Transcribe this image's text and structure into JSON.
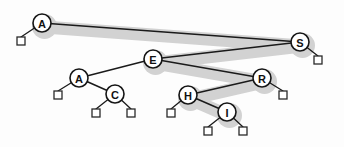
{
  "figure": {
    "background_color": "#fdfdfd",
    "node_fill": "#ffffff",
    "node_stroke": "#151515",
    "edge_color": "#1a1a1a",
    "highlight_color": "#d2d2d2",
    "null_square_fill": "#ffffff",
    "null_square_stroke": "#2a2a2a"
  },
  "chart_data": {
    "type": "diagram",
    "diagram_kind": "binary-search-tree",
    "nodes": [
      {
        "id": "n0",
        "label": "A",
        "x": 42,
        "y": 23,
        "r": 9,
        "highlighted": true
      },
      {
        "id": "n1",
        "label": "S",
        "x": 300,
        "y": 42,
        "r": 9,
        "highlighted": true
      },
      {
        "id": "n2",
        "label": "E",
        "x": 153,
        "y": 59,
        "r": 9,
        "highlighted": true
      },
      {
        "id": "n3",
        "label": "A",
        "x": 79,
        "y": 78,
        "r": 9,
        "highlighted": false
      },
      {
        "id": "n4",
        "label": "R",
        "x": 262,
        "y": 78,
        "r": 9,
        "highlighted": true
      },
      {
        "id": "n5",
        "label": "C",
        "x": 115,
        "y": 94,
        "r": 9,
        "highlighted": false
      },
      {
        "id": "n6",
        "label": "H",
        "x": 188,
        "y": 95,
        "r": 9,
        "highlighted": true
      },
      {
        "id": "n7",
        "label": "I",
        "x": 227,
        "y": 112,
        "r": 9,
        "highlighted": true
      }
    ],
    "edges": [
      {
        "from": "n0",
        "to": "n1",
        "label": "A-S"
      },
      {
        "from": "n1",
        "to": "n2",
        "label": "S-E"
      },
      {
        "from": "n2",
        "to": "n3",
        "label": "E-A"
      },
      {
        "from": "n2",
        "to": "n4",
        "label": "E-R"
      },
      {
        "from": "n3",
        "to": "n5",
        "label": "A-C"
      },
      {
        "from": "n4",
        "to": "n6",
        "label": "R-H"
      },
      {
        "from": "n6",
        "to": "n7",
        "label": "H-I"
      }
    ],
    "null_links": [
      {
        "parent": "n0",
        "side": "left",
        "x": 21,
        "y": 41,
        "size": 8
      },
      {
        "parent": "n1",
        "side": "right",
        "x": 318,
        "y": 60,
        "size": 8
      },
      {
        "parent": "n3",
        "side": "left",
        "x": 58,
        "y": 95,
        "size": 8
      },
      {
        "parent": "n4",
        "side": "right",
        "x": 283,
        "y": 95,
        "size": 8
      },
      {
        "parent": "n5",
        "side": "left",
        "x": 96,
        "y": 113,
        "size": 8
      },
      {
        "parent": "n5",
        "side": "right",
        "x": 131,
        "y": 113,
        "size": 8
      },
      {
        "parent": "n6",
        "side": "left",
        "x": 171,
        "y": 113,
        "size": 8
      },
      {
        "parent": "n7",
        "side": "left",
        "x": 208,
        "y": 131,
        "size": 8
      },
      {
        "parent": "n7",
        "side": "right",
        "x": 243,
        "y": 131,
        "size": 8
      }
    ],
    "highlight_path": [
      "A",
      "S",
      "E",
      "R",
      "H",
      "I"
    ],
    "highlight_path_points": [
      {
        "x": 44,
        "y": 27
      },
      {
        "x": 302,
        "y": 46
      },
      {
        "x": 155,
        "y": 63
      },
      {
        "x": 264,
        "y": 82
      },
      {
        "x": 190,
        "y": 99
      },
      {
        "x": 229,
        "y": 116
      }
    ]
  }
}
